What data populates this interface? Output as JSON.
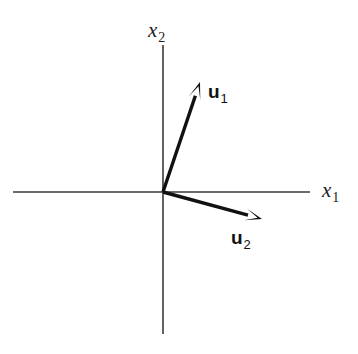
{
  "figure": {
    "width": 358,
    "height": 354,
    "background_color": "#ffffff"
  },
  "chart_data": {
    "type": "scatter",
    "title": "",
    "xlabel": "x_1",
    "ylabel": "x_2",
    "grid": false,
    "legend": "none",
    "axes": {
      "origin_px": [
        163,
        192
      ],
      "horizontal_axis": {
        "label_text": "x",
        "label_subscript": "1",
        "start_px": [
          13,
          192
        ],
        "end_px": [
          310,
          192
        ],
        "color": "#3a3a3a",
        "width_px": 1.6,
        "arrow": false
      },
      "vertical_axis": {
        "label_text": "x",
        "label_subscript": "2",
        "start_px": [
          163,
          45
        ],
        "end_px": [
          163,
          334
        ],
        "color": "#3a3a3a",
        "width_px": 1.6,
        "arrow": false
      }
    },
    "vectors": [
      {
        "name": "u_1",
        "label_text": "u",
        "label_subscript": "1",
        "tail_px": [
          163,
          192
        ],
        "tip_px": [
          200,
          82
        ],
        "components_px": [
          37,
          110
        ],
        "angle_deg_from_x_axis": 71.4,
        "length_px": 116,
        "color": "#111111",
        "width_px": 3.4,
        "label_pos_px": [
          208,
          82
        ]
      },
      {
        "name": "u_2",
        "label_text": "u",
        "label_subscript": "2",
        "tail_px": [
          163,
          192
        ],
        "tip_px": [
          262,
          219
        ],
        "components_px": [
          99,
          -27
        ],
        "angle_deg_from_x_axis": -15.3,
        "length_px": 103,
        "color": "#111111",
        "width_px": 3.4,
        "label_pos_px": [
          231,
          228
        ]
      }
    ],
    "colors": {
      "axis": "#3a3a3a",
      "vector": "#111111",
      "label": "#222222",
      "background": "#ffffff"
    }
  }
}
